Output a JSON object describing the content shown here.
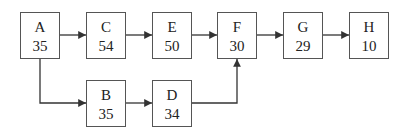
{
  "diagram": {
    "nodes": [
      {
        "id": "A",
        "label": "A",
        "value": "35"
      },
      {
        "id": "C",
        "label": "C",
        "value": "54"
      },
      {
        "id": "E",
        "label": "E",
        "value": "50"
      },
      {
        "id": "F",
        "label": "F",
        "value": "30"
      },
      {
        "id": "G",
        "label": "G",
        "value": "29"
      },
      {
        "id": "H",
        "label": "H",
        "value": "10"
      },
      {
        "id": "B",
        "label": "B",
        "value": "35"
      },
      {
        "id": "D",
        "label": "D",
        "value": "34"
      }
    ],
    "edges": [
      {
        "from": "A",
        "to": "C"
      },
      {
        "from": "C",
        "to": "E"
      },
      {
        "from": "E",
        "to": "F"
      },
      {
        "from": "F",
        "to": "G"
      },
      {
        "from": "G",
        "to": "H"
      },
      {
        "from": "A",
        "to": "B"
      },
      {
        "from": "B",
        "to": "D"
      },
      {
        "from": "D",
        "to": "F"
      }
    ],
    "colors": {
      "line": "#333333",
      "border": "#555555",
      "text": "#222222"
    }
  }
}
